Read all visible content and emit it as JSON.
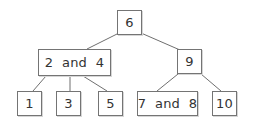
{
  "diagram": {
    "type": "2-3 tree",
    "colors": {
      "border": "#747474",
      "edge": "#6f6f6f",
      "text": "#333333",
      "background": "#ffffff"
    },
    "nodes": {
      "root": {
        "label": "6"
      },
      "left_internal": {
        "label": "2  and  4"
      },
      "right_internal": {
        "label": "9"
      },
      "leaf_1": {
        "label": "1"
      },
      "leaf_3": {
        "label": "3"
      },
      "leaf_5": {
        "label": "5"
      },
      "leaf_7_8": {
        "label": "7  and  8"
      },
      "leaf_10": {
        "label": "10"
      }
    },
    "edges": [
      {
        "from": "root",
        "to": "left_internal"
      },
      {
        "from": "root",
        "to": "right_internal"
      },
      {
        "from": "left_internal",
        "to": "leaf_1"
      },
      {
        "from": "left_internal",
        "to": "leaf_3"
      },
      {
        "from": "left_internal",
        "to": "leaf_5"
      },
      {
        "from": "right_internal",
        "to": "leaf_7_8"
      },
      {
        "from": "right_internal",
        "to": "leaf_10"
      }
    ]
  }
}
